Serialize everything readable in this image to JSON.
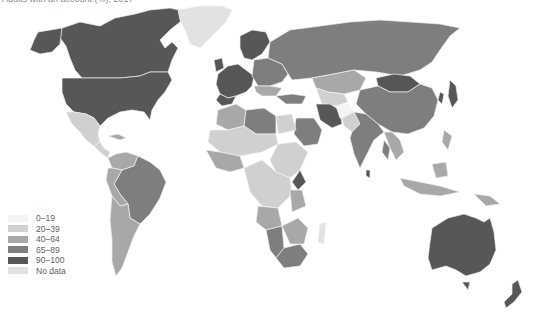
{
  "title": "Adults with an account (%), 2017",
  "legend": {
    "items": [
      {
        "label": "0–19",
        "color": "#f4f4f4"
      },
      {
        "label": "20–39",
        "color": "#d0d0d0"
      },
      {
        "label": "40–64",
        "color": "#a8a8a8"
      },
      {
        "label": "65–89",
        "color": "#7e7e7e"
      },
      {
        "label": "90–100",
        "color": "#575757"
      },
      {
        "label": "No data",
        "color": "#e2e2e2"
      }
    ]
  },
  "colors": {
    "background": "#ffffff",
    "border": "#f2f2f2"
  }
}
